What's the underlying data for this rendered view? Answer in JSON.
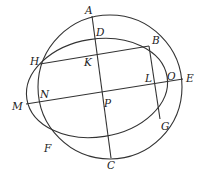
{
  "diagram": {
    "type": "geometry",
    "colors": {
      "line": "#333333",
      "label": "#222222",
      "background": "#ffffff"
    },
    "points": {
      "A": {
        "label": "A",
        "x": 92,
        "y": 17
      },
      "B": {
        "label": "B",
        "x": 149,
        "y": 46
      },
      "D": {
        "label": "D",
        "x": 94,
        "y": 38
      },
      "H": {
        "label": "H",
        "x": 40,
        "y": 64
      },
      "K": {
        "label": "K",
        "x": 95,
        "y": 52
      },
      "L": {
        "label": "L",
        "x": 155,
        "y": 84
      },
      "O": {
        "label": "O",
        "x": 165,
        "y": 82
      },
      "E": {
        "label": "E",
        "x": 183,
        "y": 79
      },
      "M": {
        "label": "M",
        "x": 26,
        "y": 104
      },
      "N": {
        "label": "N",
        "x": 37,
        "y": 102
      },
      "P": {
        "label": "P",
        "x": 103,
        "y": 97
      },
      "F": {
        "label": "F",
        "x": 51,
        "y": 135
      },
      "G": {
        "label": "G",
        "x": 160,
        "y": 119
      },
      "C": {
        "label": "C",
        "x": 111,
        "y": 157
      }
    },
    "labels": [
      {
        "id": "A",
        "text": "A",
        "x": 85,
        "y": 14
      },
      {
        "id": "D",
        "text": "D",
        "x": 96,
        "y": 36
      },
      {
        "id": "B",
        "text": "B",
        "x": 152,
        "y": 44
      },
      {
        "id": "H",
        "text": "H",
        "x": 30,
        "y": 65
      },
      {
        "id": "K",
        "text": "K",
        "x": 84,
        "y": 66
      },
      {
        "id": "L",
        "text": "L",
        "x": 145,
        "y": 82
      },
      {
        "id": "O",
        "text": "O",
        "x": 167,
        "y": 80
      },
      {
        "id": "E",
        "text": "E",
        "x": 186,
        "y": 82
      },
      {
        "id": "M",
        "text": "M",
        "x": 12,
        "y": 110
      },
      {
        "id": "N",
        "text": "N",
        "x": 40,
        "y": 98
      },
      {
        "id": "P",
        "text": "P",
        "x": 104,
        "y": 107
      },
      {
        "id": "F",
        "text": "F",
        "x": 44,
        "y": 152
      },
      {
        "id": "G",
        "text": "G",
        "x": 161,
        "y": 130
      },
      {
        "id": "C",
        "text": "C",
        "x": 107,
        "y": 169
      }
    ],
    "segments": [
      [
        "H",
        "B"
      ],
      [
        "M",
        "E"
      ],
      [
        "A",
        "C"
      ],
      [
        "B",
        "G"
      ]
    ]
  }
}
